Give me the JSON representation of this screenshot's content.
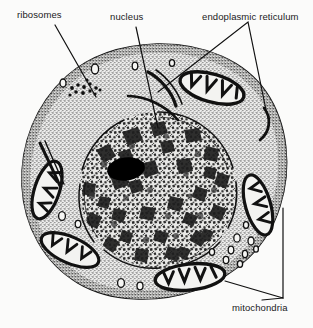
{
  "figure": {
    "type": "biological-diagram",
    "background_color": "#fbfbfa",
    "ink_color": "#111111",
    "width": 313,
    "height": 328
  },
  "labels": {
    "ribosomes": "ribosomes",
    "nucleus": "nucleus",
    "endoplasmic_reticulum": "endoplasmic reticulum",
    "mitochondria": "mitochondria"
  },
  "structures": {
    "cell_membrane": {
      "name": "cell membrane outline",
      "shape": "irregular rounded blob",
      "fill": "stippled light grey"
    },
    "cytoplasm": {
      "name": "cytoplasm",
      "texture": "fine stipple dots",
      "tone": "#d9d9d6"
    },
    "nucleus": {
      "name": "nucleus",
      "shape": "large off-centre circle",
      "texture": "mottled chromatin",
      "envelope": "double line with gaps (nuclear pores)"
    },
    "nucleolus": {
      "name": "nucleolus",
      "shape": "solid dark oval",
      "color": "#000000"
    },
    "mitochondria_count": 5,
    "ribosome_cluster": "small dark dots near upper-left cytoplasm",
    "vesicles": "small open circles scattered in cytoplasm",
    "er_cisternae": "elongated narrow sacs, upper-centre and left"
  },
  "leader_lines": [
    {
      "label": "ribosomes",
      "from": [
        60,
        26
      ],
      "to": [
        96,
        96
      ]
    },
    {
      "label": "nucleus",
      "from": [
        138,
        28
      ],
      "to": [
        158,
        128
      ]
    },
    {
      "label": "endoplasmic reticulum",
      "from": [
        248,
        28
      ],
      "to": [
        158,
        92
      ]
    },
    {
      "label": "endoplasmic reticulum",
      "from": [
        248,
        28
      ],
      "to": [
        266,
        112
      ]
    },
    {
      "label": "mitochondria",
      "from": [
        262,
        298
      ],
      "to": [
        228,
        282
      ]
    },
    {
      "label": "mitochondria",
      "from": [
        262,
        298
      ],
      "to": [
        262,
        208
      ]
    }
  ]
}
